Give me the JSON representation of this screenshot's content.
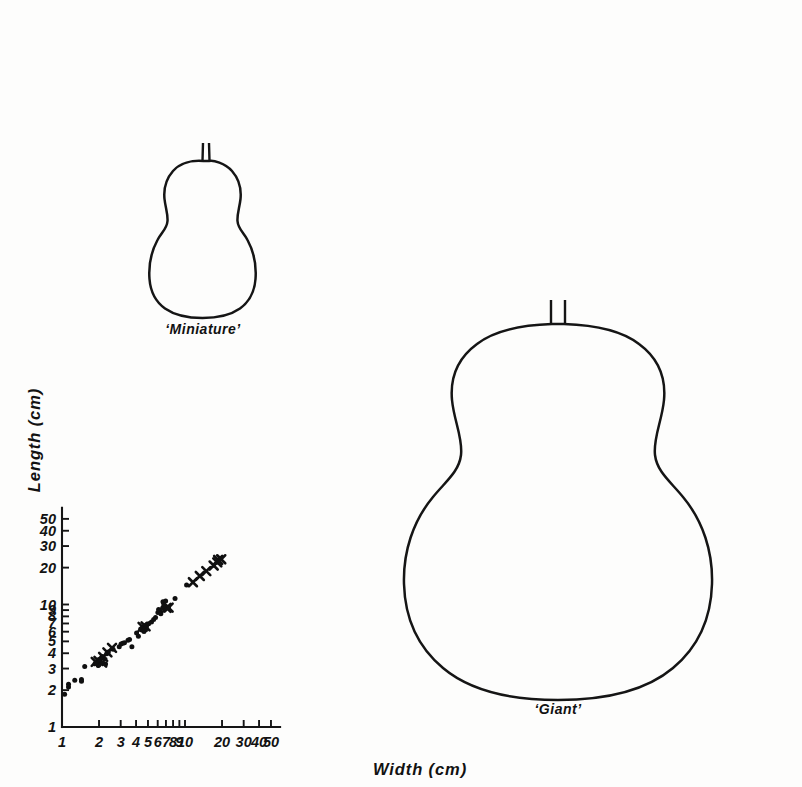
{
  "figure": {
    "background_color": "#fdfdfc",
    "ink_color": "#151515"
  },
  "chart_data": {
    "type": "scatter",
    "title": "",
    "xlabel": "Width  (cm)",
    "ylabel": "Length  (cm)",
    "xscale": "log",
    "yscale": "log",
    "xlim": [
      1,
      55
    ],
    "ylim": [
      1,
      55
    ],
    "grid": false,
    "legend": null,
    "xticks": [
      1,
      2,
      3,
      4,
      5,
      6,
      7,
      8,
      9,
      10,
      20,
      30,
      40,
      50
    ],
    "xtick_labels": [
      "1",
      "2",
      "3",
      "4",
      "5",
      "6",
      "7",
      "8",
      "9",
      "10",
      "20",
      "30",
      "40",
      "50"
    ],
    "yticks": [
      1,
      2,
      3,
      4,
      5,
      6,
      7,
      8,
      9,
      10,
      20,
      30,
      40,
      50
    ],
    "ytick_labels": [
      "1",
      "2",
      "3",
      "4",
      "5",
      "6",
      "7",
      "8",
      "9",
      "10",
      "20",
      "30",
      "40",
      "50"
    ],
    "series": [
      {
        "name": "dot-observations",
        "marker": "dot",
        "points": [
          [
            1.05,
            1.85
          ],
          [
            1.13,
            2.12
          ],
          [
            1.13,
            2.23
          ],
          [
            1.27,
            2.41
          ],
          [
            1.44,
            2.44
          ],
          [
            1.44,
            2.36
          ],
          [
            1.53,
            3.12
          ],
          [
            1.86,
            3.3
          ],
          [
            1.93,
            3.36
          ],
          [
            1.97,
            3.17
          ],
          [
            2.02,
            3.49
          ],
          [
            2.07,
            3.62
          ],
          [
            2.12,
            3.77
          ],
          [
            2.17,
            3.7
          ],
          [
            2.26,
            3.27
          ],
          [
            2.31,
            3.96
          ],
          [
            2.38,
            4.1
          ],
          [
            2.6,
            4.31
          ],
          [
            2.92,
            4.52
          ],
          [
            3.02,
            4.77
          ],
          [
            3.12,
            4.82
          ],
          [
            3.22,
            4.88
          ],
          [
            3.44,
            5.11
          ],
          [
            3.54,
            5.19
          ],
          [
            3.7,
            4.53
          ],
          [
            4.04,
            5.86
          ],
          [
            4.18,
            5.5
          ],
          [
            4.36,
            6.3
          ],
          [
            4.46,
            6.18
          ],
          [
            4.52,
            6.52
          ],
          [
            4.58,
            6.44
          ],
          [
            4.64,
            6.02
          ],
          [
            4.72,
            6.72
          ],
          [
            4.8,
            6.35
          ],
          [
            4.86,
            6.6
          ],
          [
            5.06,
            6.95
          ],
          [
            5.34,
            7.2
          ],
          [
            5.56,
            7.55
          ],
          [
            5.76,
            7.85
          ],
          [
            6.02,
            8.6
          ],
          [
            6.1,
            9.1
          ],
          [
            6.24,
            8.95
          ],
          [
            6.36,
            8.4
          ],
          [
            6.58,
            9.35
          ],
          [
            6.72,
            9.72
          ],
          [
            6.88,
            9.55
          ],
          [
            7.02,
            9.4
          ],
          [
            7.18,
            9.5
          ],
          [
            7.34,
            9.45
          ],
          [
            6.62,
            10.55
          ],
          [
            6.96,
            10.7
          ],
          [
            8.3,
            11.2
          ],
          [
            10.3,
            14.4
          ]
        ]
      },
      {
        "name": "cross-observations",
        "marker": "x",
        "points": [
          [
            1.88,
            3.4
          ],
          [
            1.98,
            3.46
          ],
          [
            2.12,
            3.36
          ],
          [
            2.16,
            3.74
          ],
          [
            2.34,
            4.06
          ],
          [
            2.55,
            4.42
          ],
          [
            4.52,
            6.56
          ],
          [
            4.78,
            6.62
          ],
          [
            7.08,
            9.38
          ],
          [
            7.36,
            9.42
          ],
          [
            11.6,
            15.2
          ],
          [
            13.2,
            17.1
          ],
          [
            14.9,
            18.7
          ],
          [
            17.1,
            20.8
          ],
          [
            18.3,
            22.1
          ],
          [
            18.6,
            23.1
          ],
          [
            19.7,
            23.4
          ]
        ]
      }
    ]
  },
  "illustrations": [
    {
      "name": "miniature-gourd",
      "label": "‘Miniature’"
    },
    {
      "name": "giant-gourd",
      "label": "‘Giant’"
    }
  ]
}
